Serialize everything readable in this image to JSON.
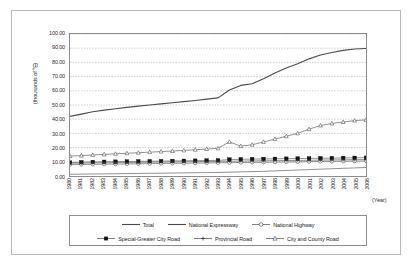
{
  "axes": {
    "ylabel": "(thousands of ㎡)",
    "xlabel": "(Year)",
    "yticks": [
      "0.00",
      "10.00",
      "20.00",
      "30.00",
      "40.00",
      "50.00",
      "60.00",
      "70.00",
      "80.00",
      "90.00",
      "100.00"
    ],
    "xticks": [
      "1980",
      "1981",
      "1982",
      "1983",
      "1984",
      "1985",
      "1986",
      "1987",
      "1988",
      "1989",
      "1990",
      "1991",
      "1992",
      "1993",
      "1994",
      "1995",
      "1996",
      "1997",
      "1998",
      "1999",
      "2000",
      "2001",
      "2002",
      "2003",
      "2004",
      "2005",
      "2006"
    ]
  },
  "legend": {
    "rows": [
      [
        {
          "label": "Total",
          "marker": "line"
        },
        {
          "label": "National Expressway",
          "marker": "line"
        },
        {
          "label": "National Highway",
          "marker": "open-circle"
        }
      ],
      [
        {
          "label": "Special-Greater City Road",
          "marker": "filled-square"
        },
        {
          "label": "Provincial Road",
          "marker": "plus"
        },
        {
          "label": "City and County Road",
          "marker": "open-triangle"
        }
      ]
    ]
  },
  "chart_data": {
    "type": "line",
    "title": "",
    "xlabel": "(Year)",
    "ylabel": "(thousands of ㎡)",
    "ylim": [
      0,
      100
    ],
    "ytick_step": 10,
    "grid": true,
    "legend_position": "bottom",
    "x": [
      1980,
      1981,
      1982,
      1983,
      1984,
      1985,
      1986,
      1987,
      1988,
      1989,
      1990,
      1991,
      1992,
      1993,
      1994,
      1995,
      1996,
      1997,
      1998,
      1999,
      2000,
      2001,
      2002,
      2003,
      2004,
      2005,
      2006
    ],
    "series": [
      {
        "name": "Total",
        "marker": "none",
        "values": [
          42.0,
          43.6,
          45.2,
          46.4,
          47.4,
          48.3,
          49.2,
          50.0,
          50.8,
          51.6,
          52.4,
          53.2,
          54.1,
          55.0,
          60.5,
          63.8,
          65.0,
          68.5,
          72.5,
          76.0,
          79.0,
          82.5,
          85.2,
          87.0,
          88.5,
          89.4,
          89.8
        ]
      },
      {
        "name": "National Expressway",
        "marker": "none",
        "values": [
          1.2,
          1.3,
          1.4,
          1.5,
          1.6,
          1.7,
          1.8,
          1.9,
          2.0,
          2.1,
          2.2,
          2.3,
          2.4,
          2.5,
          2.7,
          2.9,
          3.1,
          3.3,
          3.6,
          3.9,
          4.2,
          4.5,
          4.8,
          5.1,
          5.4,
          5.7,
          6.0
        ]
      },
      {
        "name": "National Highway",
        "marker": "open-circle",
        "values": [
          8.0,
          8.1,
          8.2,
          8.3,
          8.4,
          8.5,
          8.6,
          8.7,
          8.8,
          8.9,
          9.0,
          9.1,
          9.2,
          9.3,
          9.4,
          9.5,
          9.6,
          9.7,
          9.8,
          9.9,
          10.0,
          10.1,
          10.2,
          10.3,
          10.4,
          10.5,
          10.6
        ]
      },
      {
        "name": "Special-Greater City Road",
        "marker": "filled-square",
        "values": [
          9.5,
          9.7,
          9.9,
          10.0,
          10.1,
          10.2,
          10.3,
          10.4,
          10.5,
          10.6,
          10.7,
          10.8,
          10.9,
          11.0,
          11.6,
          11.8,
          11.9,
          12.0,
          12.1,
          12.2,
          12.3,
          12.4,
          12.5,
          12.6,
          12.7,
          12.8,
          12.9
        ]
      },
      {
        "name": "Provincial Road",
        "marker": "plus",
        "values": [
          9.0,
          9.1,
          9.2,
          9.3,
          9.4,
          9.5,
          9.6,
          9.7,
          9.8,
          9.9,
          10.0,
          10.1,
          10.2,
          10.3,
          10.4,
          10.5,
          10.6,
          10.7,
          10.8,
          10.9,
          11.0,
          11.1,
          11.2,
          11.3,
          11.4,
          11.5,
          11.6
        ]
      },
      {
        "name": "City and County Road",
        "marker": "open-triangle",
        "values": [
          14.0,
          14.4,
          14.8,
          15.2,
          15.6,
          16.0,
          16.4,
          16.8,
          17.2,
          17.6,
          18.0,
          18.5,
          19.0,
          19.5,
          24.0,
          21.0,
          22.0,
          24.0,
          26.0,
          28.0,
          30.0,
          33.0,
          35.5,
          37.0,
          38.0,
          39.0,
          39.5
        ]
      }
    ]
  }
}
